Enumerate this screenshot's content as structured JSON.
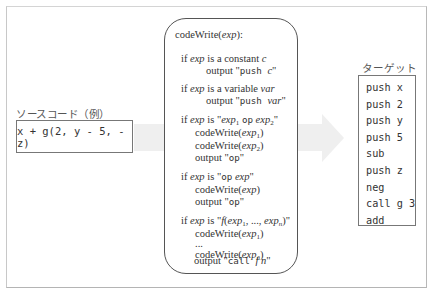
{
  "source": {
    "label": "ソースコード（例）",
    "code": "x + g(2, y - 5, -z)"
  },
  "algorithm": {
    "title_fn": "codeWrite(",
    "title_arg": "exp",
    "title_end": "):",
    "cases": [
      {
        "condition": {
          "prefix": "if ",
          "exp": "exp",
          "mid": " is a constant ",
          "var": "c"
        },
        "body": [
          {
            "kind": "output",
            "text": "output ",
            "code": "\"push ",
            "var": "c",
            "close": "\""
          }
        ]
      },
      {
        "condition": {
          "prefix": "if ",
          "exp": "exp",
          "mid": " is a variable ",
          "var": "var"
        },
        "body": [
          {
            "kind": "output",
            "text": "output ",
            "code": "\"push ",
            "var": "var",
            "close": "\""
          }
        ]
      },
      {
        "condition": {
          "prefix": "if ",
          "exp": "exp",
          "mid": " is ",
          "pattern": "\"exp1 op exp2\""
        },
        "body": [
          "codeWrite(exp1)",
          "codeWrite(exp2)",
          "output \"op\""
        ]
      },
      {
        "condition": {
          "prefix": "if ",
          "exp": "exp",
          "mid": " is ",
          "pattern": "\"op exp\""
        },
        "body": [
          "codeWrite(exp)",
          "output \"op\""
        ]
      },
      {
        "condition": {
          "prefix": "if ",
          "exp": "exp",
          "mid": " is ",
          "pattern": "\"f(exp1, ..., expn)\""
        },
        "body": [
          "codeWrite(exp1)",
          "...",
          "codeWrite(expn)",
          "output \"call f n\""
        ]
      }
    ],
    "texts": {
      "if": "if ",
      "exp": "exp",
      "is": " is ",
      "is_const": " is a constant ",
      "c": "c",
      "is_var": " is a variable ",
      "var": "var",
      "output": "output ",
      "push": "push ",
      "q": "\"",
      "cw": "codeWrite(",
      "rp": ")",
      "op": "op",
      "sp": " ",
      "one": "1",
      "two": "2",
      "n": "n",
      "f": "f",
      "lp": "(",
      "comma_dots": ", ..., ",
      "dots": "...",
      "call": "call ",
      "colon": "):"
    }
  },
  "target": {
    "label": "ターゲット",
    "lines": [
      "push x",
      "push 2",
      "push y",
      "push 5",
      "sub",
      "push z",
      "neg",
      "call g 3",
      "add"
    ]
  },
  "colors": {
    "arrow": "#efefef",
    "box_border": "#777777",
    "frame_border": "#c0c0c0"
  }
}
